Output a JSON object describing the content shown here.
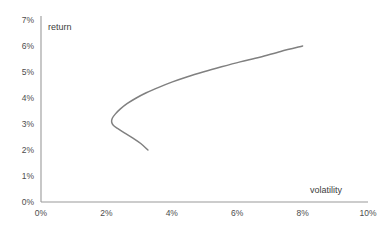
{
  "chart_data": {
    "type": "line",
    "title": "",
    "xlabel": "volatility",
    "ylabel": "return",
    "xlim": [
      0,
      10
    ],
    "ylim": [
      0,
      7
    ],
    "grid": false,
    "legend": null,
    "xticks": [
      "0%",
      "2%",
      "4%",
      "6%",
      "8%",
      "10%"
    ],
    "xtick_values": [
      0,
      2,
      4,
      6,
      8,
      10
    ],
    "yticks": [
      "0%",
      "1%",
      "2%",
      "3%",
      "4%",
      "5%",
      "6%",
      "7%"
    ],
    "ytick_values": [
      0,
      1,
      2,
      3,
      4,
      5,
      6,
      7
    ],
    "series": [
      {
        "name": "efficient frontier",
        "color": "#808080",
        "points": [
          [
            3.27,
            2.0
          ],
          [
            3.05,
            2.25
          ],
          [
            2.8,
            2.47
          ],
          [
            2.55,
            2.66
          ],
          [
            2.34,
            2.83
          ],
          [
            2.21,
            2.95
          ],
          [
            2.16,
            3.08
          ],
          [
            2.18,
            3.22
          ],
          [
            2.27,
            3.38
          ],
          [
            2.42,
            3.57
          ],
          [
            2.63,
            3.78
          ],
          [
            2.9,
            3.99
          ],
          [
            3.22,
            4.2
          ],
          [
            3.6,
            4.41
          ],
          [
            4.02,
            4.62
          ],
          [
            4.48,
            4.82
          ],
          [
            4.98,
            5.01
          ],
          [
            5.52,
            5.2
          ],
          [
            6.09,
            5.39
          ],
          [
            6.69,
            5.57
          ],
          [
            7.33,
            5.79
          ],
          [
            8.0,
            6.0
          ]
        ]
      }
    ]
  },
  "axes": {
    "axis_color": "#9a9a9a",
    "label_color": "#4d4d4d"
  }
}
